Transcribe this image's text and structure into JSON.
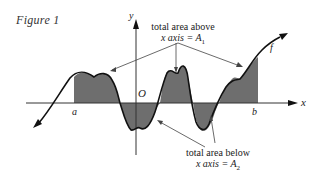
{
  "figure": {
    "caption": "Figure 1",
    "axis_labels": {
      "x": "x",
      "y": "y",
      "origin": "O"
    },
    "interval_labels": {
      "a": "a",
      "b": "b"
    },
    "function_label": "f",
    "annotation_above": {
      "line1": "total area above",
      "line2_prefix": "x axis = A",
      "subscript": "1"
    },
    "annotation_below": {
      "line1": "total area below",
      "line2_prefix": "x axis = A",
      "subscript": "2"
    },
    "colors": {
      "shade": "#6e6e6e",
      "curve": "#111111",
      "axis": "#333333",
      "background": "#ffffff"
    }
  }
}
